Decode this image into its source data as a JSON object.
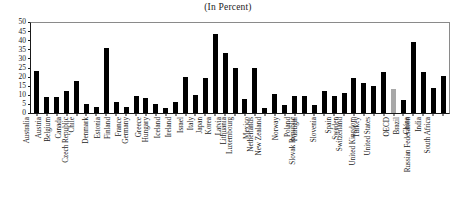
{
  "chart_data": {
    "type": "bar",
    "title": "(In Percent)",
    "subtitle": "",
    "xlabel": "",
    "ylabel": "",
    "ylim": [
      0,
      50
    ],
    "yticks": [
      0,
      5,
      10,
      15,
      20,
      25,
      30,
      35,
      40,
      45,
      50
    ],
    "ytick_labels": [
      "0",
      "5",
      "10",
      "15",
      "20",
      "25",
      "30",
      "35",
      "40",
      "45",
      "50"
    ],
    "grid": false,
    "legend": false,
    "legend_position": "none",
    "bar_color": "#000000",
    "highlight_color": "#a8a8a8",
    "highlight_categories": [
      "OECD"
    ],
    "categories": [
      "Australia",
      "Austria",
      "Belgium",
      "Canada",
      "Chile",
      "Czech Republic",
      "Denmark",
      "Estonia",
      "Finland",
      "France",
      "Germany",
      "Greece",
      "Hungary",
      "Iceland",
      "Ireland",
      "Israel",
      "Italy",
      "Japan",
      "Korea",
      "Latvia",
      "Lithuania",
      "Luxembourg",
      "Mexico",
      "Netherlands",
      "New Zealand",
      "Norway",
      "Poland",
      "Potrugal",
      "Slovak Republic",
      "Slovenia",
      "Spain",
      "Sweden",
      "Switzerland",
      "Turkey",
      "United Kingdom",
      "United States",
      "OECD",
      "Brazil",
      "China",
      "India",
      "Russian Federation",
      "South Africa"
    ],
    "values": [
      23.0,
      8.8,
      8.6,
      12.0,
      17.5,
      4.8,
      3.2,
      35.5,
      6.2,
      3.4,
      9.6,
      8.0,
      5.0,
      2.6,
      5.8,
      19.8,
      10.0,
      19.4,
      43.5,
      32.8,
      25.0,
      7.6,
      24.6,
      3.0,
      10.6,
      4.2,
      9.3,
      9.4,
      4.2,
      12.0,
      9.4,
      11.2,
      19.2,
      16.6,
      15.0,
      22.6,
      13.4,
      7.4,
      39.0,
      22.4,
      13.8,
      20.6
    ]
  }
}
